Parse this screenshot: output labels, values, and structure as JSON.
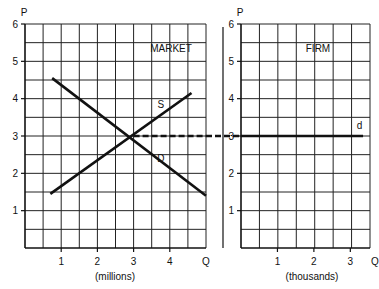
{
  "chart_data": [
    {
      "type": "line",
      "title": "MARKET",
      "xlabel": "Q",
      "xunit_label": "(millions)",
      "ylabel": "P",
      "xlim": [
        0,
        5
      ],
      "ylim": [
        0,
        6
      ],
      "xticks": [
        1,
        2,
        3,
        4
      ],
      "yticks": [
        1,
        2,
        3,
        4,
        5,
        6
      ],
      "grid": true,
      "series": [
        {
          "name": "S",
          "points": [
            [
              0.7,
              1.45
            ],
            [
              4.6,
              4.15
            ]
          ]
        },
        {
          "name": "D",
          "points": [
            [
              0.75,
              4.55
            ],
            [
              5.0,
              1.4
            ]
          ]
        },
        {
          "name": "equilibrium-price",
          "style": "dashed",
          "points": [
            [
              3.0,
              3.0
            ],
            [
              5.0,
              3.0
            ]
          ]
        }
      ],
      "annotations": [
        {
          "text": "S",
          "x": 3.75,
          "y": 3.75
        },
        {
          "text": "D",
          "x": 3.75,
          "y": 2.3
        }
      ]
    },
    {
      "type": "line",
      "title": "FIRM",
      "xlabel": "Q",
      "xunit_label": "(thousands)",
      "ylabel": "P",
      "xlim": [
        0,
        3.5
      ],
      "ylim": [
        0,
        6
      ],
      "xticks": [
        1,
        2,
        3
      ],
      "yticks": [
        1,
        2,
        3,
        4,
        5,
        6
      ],
      "grid": true,
      "series": [
        {
          "name": "d",
          "points": [
            [
              0,
              3.0
            ],
            [
              3.35,
              3.0
            ]
          ]
        }
      ],
      "annotations": [
        {
          "text": "d",
          "x": 3.25,
          "y": 3.2
        }
      ]
    }
  ],
  "connector": {
    "style": "dashed",
    "price": 3.0
  }
}
